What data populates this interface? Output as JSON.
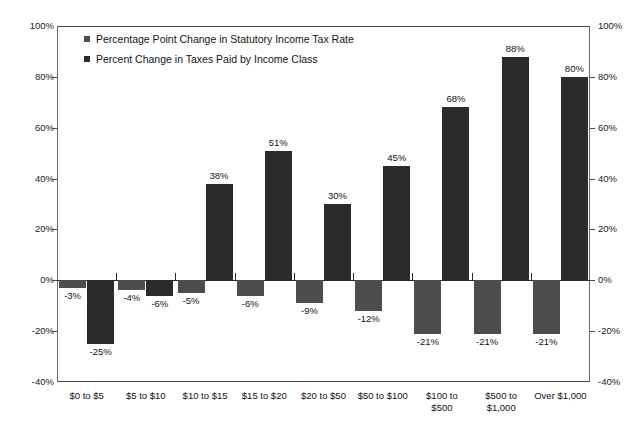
{
  "chart_data": {
    "type": "bar",
    "title": "",
    "xlabel": "",
    "ylabel": "",
    "ylim": [
      -40,
      100
    ],
    "yticks": [
      "-40%",
      "-20%",
      "0%",
      "20%",
      "40%",
      "60%",
      "80%",
      "100%"
    ],
    "ytick_values": [
      -40,
      -20,
      0,
      20,
      40,
      60,
      80,
      100
    ],
    "grid": false,
    "legend_position": "upper-left-inside",
    "dual_axis": true,
    "categories": [
      "$0 to $5",
      "$5 to $10",
      "$10 to $15",
      "$15 to $20",
      "$20 to $50",
      "$50 to $100",
      "$100 to\n$500",
      "$500 to\n$1,000",
      "Over $1,000"
    ],
    "series": [
      {
        "name": "Percentage Point Change in Statutory Income Tax Rate",
        "color": "#4d4d4d",
        "values": [
          -3,
          -4,
          -5,
          -6,
          -9,
          -12,
          -21,
          -21,
          -21
        ],
        "labels": [
          "-3%",
          "-4%",
          "-5%",
          "-6%",
          "-9%",
          "-12%",
          "-21%",
          "-21%",
          "-21%"
        ]
      },
      {
        "name": "Percent Change in Taxes Paid by Income Class",
        "color": "#2b2b2b",
        "values": [
          -25,
          -6,
          38,
          51,
          30,
          45,
          68,
          88,
          80
        ],
        "labels": [
          "-25%",
          "-6%",
          "38%",
          "51%",
          "30%",
          "45%",
          "68%",
          "88%",
          "80%"
        ]
      }
    ]
  },
  "axis": {
    "left_ticks": [
      "100%",
      "80%",
      "60%",
      "40%",
      "20%",
      "0%",
      "-20%",
      "-40%"
    ],
    "right_ticks": [
      "100%",
      "80%",
      "60%",
      "40%",
      "20%",
      "0%",
      "-20%",
      "-40%"
    ]
  },
  "legend": {
    "items": [
      {
        "label": "Percentage Point Change in Statutory Income Tax Rate"
      },
      {
        "label": "Percent Change in Taxes Paid by Income Class"
      }
    ]
  }
}
